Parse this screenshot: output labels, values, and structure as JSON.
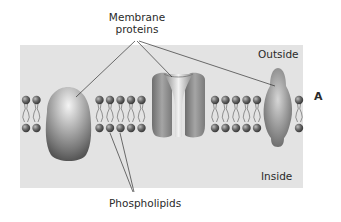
{
  "labels": {
    "membrane_proteins_line1": "Membrane",
    "membrane_proteins_line2": "proteins",
    "outside": "Outside",
    "inside": "Inside",
    "phospholipids": "Phospholipids",
    "panel_letter": "A"
  },
  "colors": {
    "panel_bg": "#e3e3e3",
    "protein": "#8c8c8c",
    "lipid_head": "#555555",
    "text": "#2a2a2a"
  }
}
